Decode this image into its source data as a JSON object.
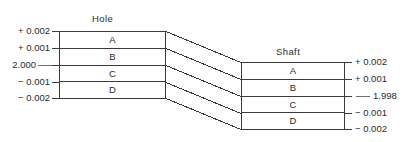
{
  "diagram": {
    "hole": {
      "title": "Hole",
      "zones": [
        {
          "label": "A"
        },
        {
          "label": "B"
        },
        {
          "label": "C"
        },
        {
          "label": "D"
        }
      ],
      "scale_labels": [
        {
          "value": "+ 0.002"
        },
        {
          "value": "+ 0.001"
        },
        {
          "value": "2.000"
        },
        {
          "value": "− 0.001"
        },
        {
          "value": "− 0.002"
        }
      ]
    },
    "shaft": {
      "title": "Shaft",
      "zones": [
        {
          "label": "A"
        },
        {
          "label": "B"
        },
        {
          "label": "C"
        },
        {
          "label": "D"
        }
      ],
      "scale_labels": [
        {
          "value": "+ 0.002"
        },
        {
          "value": "+ 0.001"
        },
        {
          "value": "1.998"
        },
        {
          "value": "− 0.001"
        },
        {
          "value": "− 0.002"
        }
      ]
    }
  },
  "style": {
    "line_color": "#3a3a3a",
    "text_color": "#2b2b2b",
    "background": "#ffffff"
  }
}
